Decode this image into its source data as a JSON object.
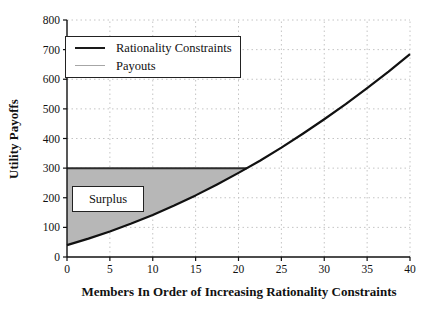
{
  "figure": {
    "background": "#ffffff"
  },
  "chart_data": {
    "type": "line",
    "title": "",
    "xlabel": "Members In Order of Increasing Rationality Constraints",
    "ylabel": "Utility Payoffs",
    "xlim": [
      0,
      40
    ],
    "ylim": [
      0,
      800
    ],
    "xticks": [
      0,
      5,
      10,
      15,
      20,
      25,
      30,
      35,
      40
    ],
    "yticks": [
      0,
      100,
      200,
      300,
      400,
      500,
      600,
      700,
      800
    ],
    "grid": "dotted",
    "grid_color": "#c4c4c4",
    "axis_color": "#111111",
    "legend_position": "top-left",
    "series": [
      {
        "name": "Rationality Constraints",
        "color": "#111111",
        "legend_color": "#1a1a1a",
        "width": 2.2,
        "x": [
          0,
          2.5,
          5,
          7.5,
          10,
          12.5,
          15,
          17.5,
          20,
          22.5,
          25,
          27.5,
          30,
          32.5,
          35,
          37.5,
          40
        ],
        "y": [
          40,
          62,
          86,
          113,
          142,
          174,
          208,
          245,
          284,
          325,
          369,
          416,
          465,
          516,
          570,
          626,
          685
        ]
      },
      {
        "name": "Payouts",
        "color": "#2b2b2b",
        "legend_color": "#a6a6a6",
        "width": 2,
        "x": [
          0,
          21
        ],
        "y": [
          300,
          300
        ]
      }
    ],
    "region": {
      "label": "Surplus",
      "fill": "#b7b7b7",
      "payout_level": 300,
      "x_start": 0,
      "x_end": 21,
      "description": "shaded area between the payouts level and the rationality-constraints curve"
    }
  }
}
